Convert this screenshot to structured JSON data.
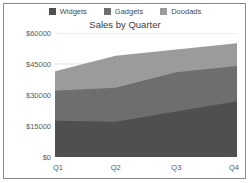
{
  "chart_data": {
    "type": "area",
    "title": "Sales by Quarter",
    "xlabel": "",
    "ylabel": "",
    "categories": [
      "Q1",
      "Q2",
      "Q3",
      "Q4"
    ],
    "stacked": true,
    "series": [
      {
        "name": "Widgets",
        "color": "#4f4f4f",
        "values": [
          17500,
          17000,
          22000,
          27000
        ]
      },
      {
        "name": "Gadgets",
        "color": "#6e6e6e",
        "values": [
          14500,
          16500,
          19000,
          17000
        ]
      },
      {
        "name": "Doodads",
        "color": "#9b9b9b",
        "values": [
          9500,
          15500,
          11000,
          11000
        ]
      }
    ],
    "cumulative_tops": {
      "Widgets": [
        17500,
        17000,
        22000,
        27000
      ],
      "Gadgets": [
        32000,
        33500,
        41000,
        44000
      ],
      "Doodads": [
        41500,
        49000,
        52000,
        55000
      ]
    },
    "ylim": [
      0,
      60000
    ],
    "yticks": [
      0,
      15000,
      30000,
      45000,
      60000
    ],
    "ytick_labels": [
      "$0",
      "$15000",
      "$30000",
      "$45000",
      "$60000"
    ],
    "grid": true,
    "gridline_color": "#d8d8d8",
    "legend_position": "top",
    "background": "#ffffff",
    "border_color": "#8a8a8a"
  },
  "legend": {
    "items": [
      {
        "label": "Widgets",
        "color": "#4f4f4f"
      },
      {
        "label": "Gadgets",
        "color": "#6e6e6e"
      },
      {
        "label": "Doodads",
        "color": "#9b9b9b"
      }
    ]
  },
  "title": {
    "text": "Sales by Quarter"
  },
  "axes": {
    "y_labels": [
      "$60000",
      "$45000",
      "$30000",
      "$15000",
      "$0"
    ],
    "x_labels": [
      "Q1",
      "Q2",
      "Q3",
      "Q4"
    ]
  }
}
